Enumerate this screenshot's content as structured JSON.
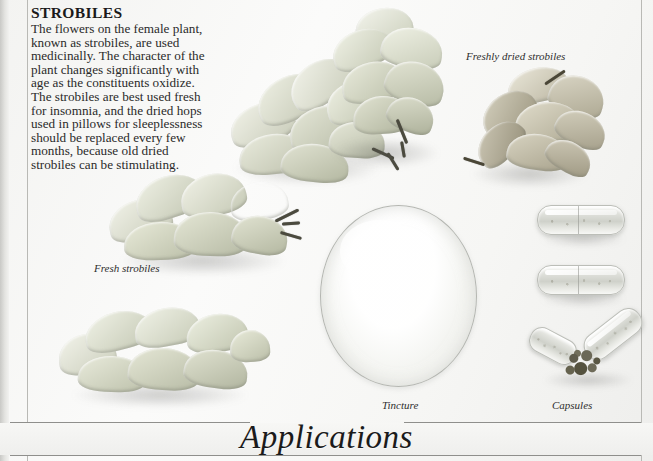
{
  "page": {
    "heading": "STROBILES",
    "body": "The flowers on the female plant, known as strobiles, are used medicinally. The character of the plant changes significantly with age as the constituents oxidize. The strobiles are best used fresh for insomnia, and the dried hops used in pillows for sleeplessness should be replaced every few months, because old dried strobiles can be stimulating.",
    "footer_title": "Applications"
  },
  "captions": {
    "freshly_dried": "Freshly dried strobiles",
    "fresh": "Fresh strobiles",
    "tincture": "Tincture",
    "capsules": "Capsules"
  },
  "colors": {
    "paper": "#f6f6f4",
    "rule": "#8f8f8c",
    "text": "#2a2a2a",
    "heading": "#1a1a1a",
    "specimen_pale": "#d8dacd",
    "specimen_dried": "#b9b4a4",
    "powder": "#5f5c4c"
  }
}
